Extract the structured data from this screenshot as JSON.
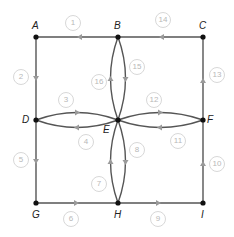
{
  "diagram": {
    "type": "directed-graph",
    "colors": {
      "edge": "#555555",
      "arrow": "#9a9a9a",
      "node": "#111111",
      "label_circle": "#d8d8d8",
      "label_text": "#b8b8b8"
    },
    "nodes": [
      {
        "id": "A",
        "label": "A",
        "x": 36,
        "y": 37
      },
      {
        "id": "B",
        "label": "B",
        "x": 118,
        "y": 37
      },
      {
        "id": "C",
        "label": "C",
        "x": 203,
        "y": 37
      },
      {
        "id": "D",
        "label": "D",
        "x": 36,
        "y": 120
      },
      {
        "id": "E",
        "label": "E",
        "x": 118,
        "y": 120
      },
      {
        "id": "F",
        "label": "F",
        "x": 203,
        "y": 120
      },
      {
        "id": "G",
        "label": "G",
        "x": 36,
        "y": 203
      },
      {
        "id": "H",
        "label": "H",
        "x": 118,
        "y": 203
      },
      {
        "id": "I",
        "label": "I",
        "x": 203,
        "y": 203
      }
    ],
    "edges": [
      {
        "label": "1",
        "from": "B",
        "to": "A"
      },
      {
        "label": "2",
        "from": "A",
        "to": "D"
      },
      {
        "label": "3",
        "from": "D",
        "to": "E"
      },
      {
        "label": "4",
        "from": "E",
        "to": "D"
      },
      {
        "label": "5",
        "from": "D",
        "to": "G"
      },
      {
        "label": "6",
        "from": "G",
        "to": "H"
      },
      {
        "label": "7",
        "from": "H",
        "to": "E"
      },
      {
        "label": "8",
        "from": "E",
        "to": "H"
      },
      {
        "label": "9",
        "from": "H",
        "to": "I"
      },
      {
        "label": "10",
        "from": "I",
        "to": "F"
      },
      {
        "label": "11",
        "from": "F",
        "to": "E"
      },
      {
        "label": "12",
        "from": "E",
        "to": "F"
      },
      {
        "label": "13",
        "from": "F",
        "to": "C"
      },
      {
        "label": "14",
        "from": "C",
        "to": "B"
      },
      {
        "label": "15",
        "from": "B",
        "to": "E"
      },
      {
        "label": "16",
        "from": "E",
        "to": "B"
      }
    ]
  }
}
